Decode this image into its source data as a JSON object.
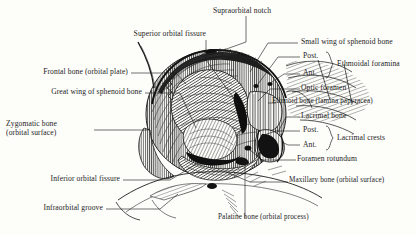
{
  "figure": {
    "type": "anatomical-illustration",
    "style": "engraved line-hatching",
    "background_color": "#fdfdfa",
    "ink_color": "#1c1c1c"
  },
  "labels": {
    "supraorbital_notch": "Supraorbital notch",
    "superior_orbital_fissure": "Superior orbital fissure",
    "frontal_bone": "Frontal bone (orbital plate)",
    "great_wing_sphenoid": "Great wing of sphenoid bone",
    "zygomatic_bone_line1": "Zygomatic bone",
    "zygomatic_bone_line2": "(orbital surface)",
    "inferior_orbital_fissure": "Inferior orbital fissure",
    "infraorbital_groove": "Infraorbital groove",
    "small_wing_sphenoid": "Small wing of sphenoid bone",
    "ethmoidal_post": "Post.",
    "ethmoidal_ant": "Ant.",
    "ethmoidal_foramina": "Ethmoidal foramina",
    "optic_foramen": "Optic foramen",
    "ethmoid_bone": "Ethmoid bone (lamina papyracea)",
    "lacrimal_bone": "Lacrimal bone",
    "lacrimal_post": "Post.",
    "lacrimal_ant": "Ant.",
    "lacrimal_crests": "Lacrimal crests",
    "foramen_rotundum": "Foramen rotundum",
    "maxillary_bone": "Maxillary bone (orbital surface)",
    "palatine_bone": "Palatine bone (orbital process)"
  }
}
